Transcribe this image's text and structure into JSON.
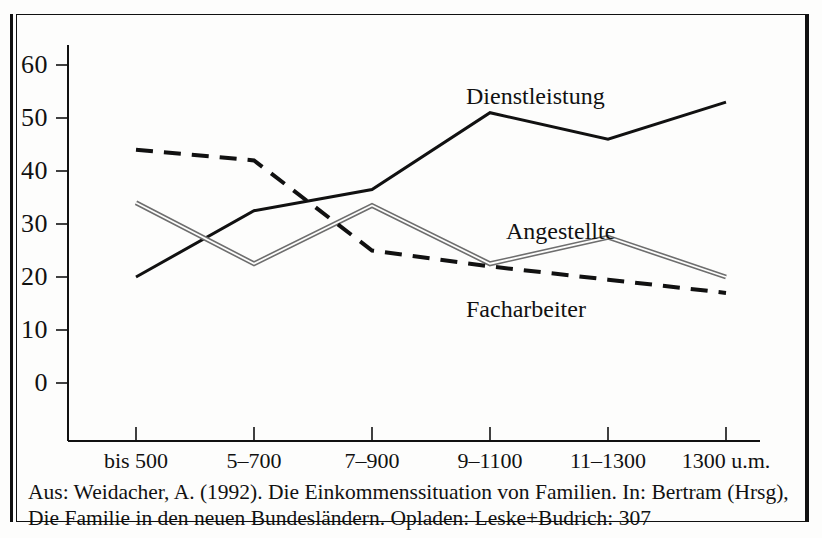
{
  "figure": {
    "caption_line_1": "Aus: Weidacher, A. (1992). Die Einkommenssituation von Familien. In: Bertram (Hrsg),",
    "caption_line_2": "Die Familie in den neuen Bundesländern. Opladen: Leske+Budrich: 307"
  },
  "chart_data": {
    "type": "line",
    "title": "",
    "xlabel": "",
    "ylabel": "",
    "grid": false,
    "legend": "inline-labels",
    "ylim": [
      0,
      65
    ],
    "yticks": [
      0,
      10,
      20,
      30,
      40,
      50,
      60
    ],
    "ytick_labels": [
      "0",
      "10",
      "20",
      "30",
      "40",
      "50",
      "60"
    ],
    "categories": [
      "bis 500",
      "5–700",
      "7–900",
      "9–1100",
      "11–1300",
      "1300 u.m."
    ],
    "series": [
      {
        "name": "Dienstleistung",
        "style": "solid",
        "color": "#111111",
        "values": [
          20,
          32.5,
          36.5,
          51,
          46,
          53
        ]
      },
      {
        "name": "Angestellte",
        "style": "double-gray",
        "color": "#8a8a8a",
        "values": [
          34,
          22.5,
          33.5,
          22.5,
          27.5,
          20
        ]
      },
      {
        "name": "Facharbeiter",
        "style": "dashed",
        "color": "#111111",
        "values": [
          44,
          42,
          25,
          22,
          19.5,
          17
        ]
      }
    ],
    "annotations": [
      {
        "text": "Dienstleistung",
        "x": 466,
        "y": 84
      },
      {
        "text": "Angestellte",
        "x": 506,
        "y": 219
      },
      {
        "text": "Facharbeiter",
        "x": 466,
        "y": 297
      }
    ]
  }
}
